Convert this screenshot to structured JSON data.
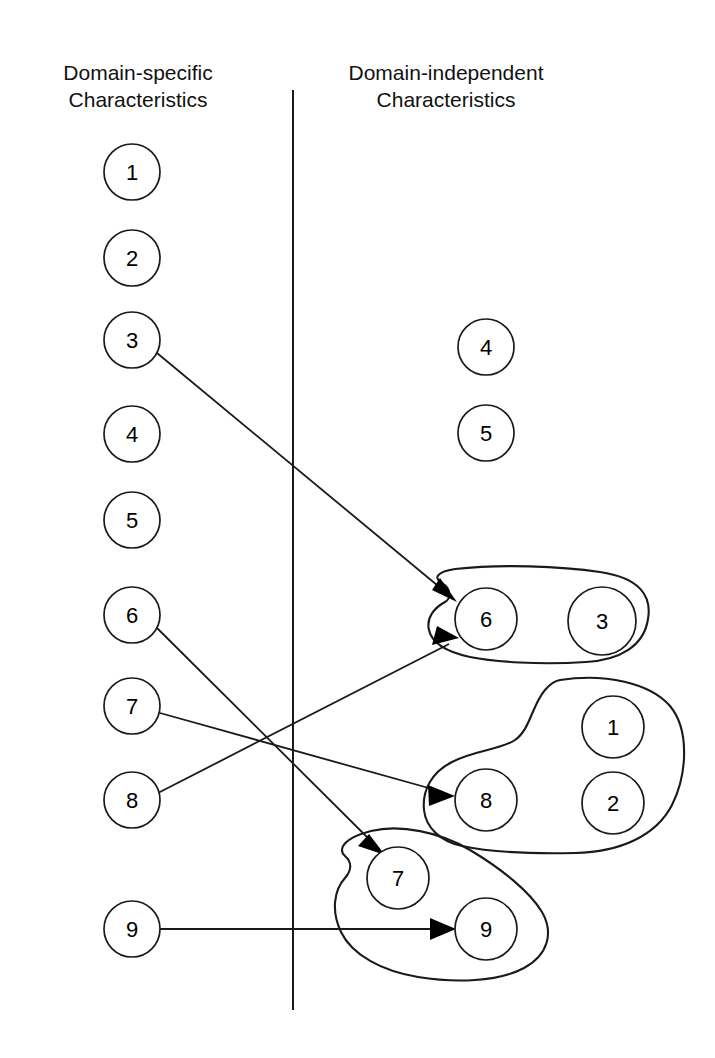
{
  "diagram": {
    "columns": {
      "left": {
        "heading_line1": "Domain-specific",
        "heading_line2": "Characteristics"
      },
      "right": {
        "heading_line1": "Domain-independent",
        "heading_line2": "Characteristics"
      }
    },
    "divider": {
      "x": 293,
      "y1": 90,
      "y2": 1010,
      "color": "#1a1a1a"
    },
    "left_nodes": [
      {
        "id": "L1",
        "label": "1",
        "cx": 132,
        "cy": 172,
        "r": 28
      },
      {
        "id": "L2",
        "label": "2",
        "cx": 132,
        "cy": 258,
        "r": 28
      },
      {
        "id": "L3",
        "label": "3",
        "cx": 132,
        "cy": 340,
        "r": 28
      },
      {
        "id": "L4",
        "label": "4",
        "cx": 132,
        "cy": 434,
        "r": 28
      },
      {
        "id": "L5",
        "label": "5",
        "cx": 132,
        "cy": 520,
        "r": 28
      },
      {
        "id": "L6",
        "label": "6",
        "cx": 132,
        "cy": 615,
        "r": 28
      },
      {
        "id": "L7",
        "label": "7",
        "cx": 132,
        "cy": 706,
        "r": 28
      },
      {
        "id": "L8",
        "label": "8",
        "cx": 132,
        "cy": 800,
        "r": 28
      },
      {
        "id": "L9",
        "label": "9",
        "cx": 132,
        "cy": 929,
        "r": 28
      }
    ],
    "right_nodes": [
      {
        "id": "R4",
        "label": "4",
        "cx": 486,
        "cy": 347,
        "r": 28,
        "group": null
      },
      {
        "id": "R5",
        "label": "5",
        "cx": 486,
        "cy": 433,
        "r": 28,
        "group": null
      },
      {
        "id": "R6",
        "label": "6",
        "cx": 486,
        "cy": 619,
        "r": 31,
        "group": "G1"
      },
      {
        "id": "R3",
        "label": "3",
        "cx": 602,
        "cy": 621,
        "r": 34,
        "group": "G1"
      },
      {
        "id": "R1",
        "label": "1",
        "cx": 613,
        "cy": 727,
        "r": 31,
        "group": "G2"
      },
      {
        "id": "R8",
        "label": "8",
        "cx": 486,
        "cy": 800,
        "r": 31,
        "group": "G2"
      },
      {
        "id": "R2",
        "label": "2",
        "cx": 613,
        "cy": 803,
        "r": 31,
        "group": "G2"
      },
      {
        "id": "R7",
        "label": "7",
        "cx": 398,
        "cy": 878,
        "r": 31,
        "group": "G3"
      },
      {
        "id": "R9",
        "label": "9",
        "cx": 486,
        "cy": 929,
        "r": 31,
        "group": "G3"
      }
    ],
    "groups": [
      {
        "id": "G1",
        "members": [
          "6",
          "3"
        ]
      },
      {
        "id": "G2",
        "members": [
          "8",
          "1",
          "2"
        ]
      },
      {
        "id": "G3",
        "members": [
          "7",
          "9"
        ]
      }
    ],
    "arrows": [
      {
        "id": "A1",
        "from": "L3",
        "to": "R6",
        "x1": 157,
        "y1": 353,
        "x2": 455,
        "y2": 600
      },
      {
        "id": "A2",
        "from": "L6",
        "to": "R7",
        "x1": 157,
        "y1": 628,
        "x2": 383,
        "y2": 852
      },
      {
        "id": "A3",
        "from": "L7",
        "to": "R8",
        "x1": 160,
        "y1": 713,
        "x2": 452,
        "y2": 795
      },
      {
        "id": "A4",
        "from": "L8",
        "to": "R6",
        "x1": 158,
        "y1": 793,
        "x2": 458,
        "y2": 638
      },
      {
        "id": "A5",
        "from": "L9",
        "to": "R9",
        "x1": 160,
        "y1": 929,
        "x2": 452,
        "y2": 929
      }
    ]
  }
}
